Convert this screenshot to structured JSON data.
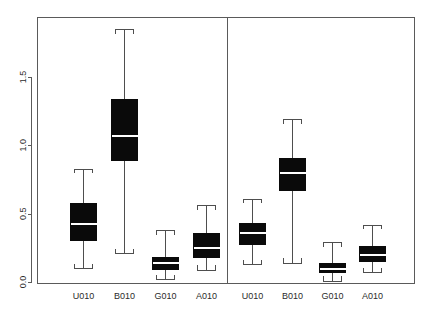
{
  "chart_data": {
    "type": "box",
    "title": "",
    "xlabel": "",
    "ylabel": "",
    "ylim": [
      -0.02,
      1.93
    ],
    "yticks": [
      0.0,
      0.5,
      1.0,
      1.5
    ],
    "ytick_labels": [
      "0.0",
      "0.5",
      "1.0",
      "1.5"
    ],
    "grid": false,
    "legend": "none",
    "panels": [
      {
        "name": "left-panel",
        "categories": [
          "U010",
          "B010",
          "G010",
          "A010"
        ],
        "boxes": [
          {
            "label": "U010",
            "whisker_low": 0.1,
            "q1": 0.31,
            "median": 0.43,
            "q3": 0.58,
            "whisker_high": 0.83
          },
          {
            "label": "B010",
            "whisker_low": 0.21,
            "q1": 0.89,
            "median": 1.07,
            "q3": 1.34,
            "whisker_high": 1.85
          },
          {
            "label": "G010",
            "whisker_low": 0.02,
            "q1": 0.095,
            "median": 0.14,
            "q3": 0.18,
            "whisker_high": 0.38
          },
          {
            "label": "A010",
            "whisker_low": 0.09,
            "q1": 0.18,
            "median": 0.25,
            "q3": 0.36,
            "whisker_high": 0.56
          }
        ]
      },
      {
        "name": "right-panel",
        "categories": [
          "U010",
          "B010",
          "G010",
          "A010"
        ],
        "boxes": [
          {
            "label": "U010",
            "whisker_low": 0.13,
            "q1": 0.28,
            "median": 0.36,
            "q3": 0.43,
            "whisker_high": 0.61
          },
          {
            "label": "B010",
            "whisker_low": 0.14,
            "q1": 0.67,
            "median": 0.8,
            "q3": 0.91,
            "whisker_high": 1.19
          },
          {
            "label": "G010",
            "whisker_low": 0.01,
            "q1": 0.073,
            "median": 0.1,
            "q3": 0.14,
            "whisker_high": 0.29
          },
          {
            "label": "A010",
            "whisker_low": 0.073,
            "q1": 0.15,
            "median": 0.2,
            "q3": 0.26,
            "whisker_high": 0.42
          }
        ]
      }
    ],
    "colors": {
      "box_fill": "#0a0a0a",
      "median_line": "#ffffff",
      "whisker": "#4e4e4e",
      "frame": "#5a5a5a",
      "background": "#ffffff",
      "text": "#2b2b2b"
    }
  },
  "geometry": {
    "plot_left": 37,
    "plot_right": 414,
    "plot_top": 17,
    "plot_bottom": 283,
    "panel_divider_x": 227,
    "y_zero_px": 282,
    "px_per_unit": 136.67,
    "box_half_width": 13,
    "cap_half_width": 9,
    "box_centers": [
      83,
      124,
      165,
      206,
      252,
      292,
      332,
      372
    ]
  }
}
